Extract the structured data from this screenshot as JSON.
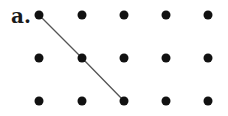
{
  "label": "a.",
  "grid": {
    "cols": [
      39,
      82,
      124,
      166,
      208
    ],
    "rows": [
      15,
      58,
      101
    ],
    "dot_radius": 4.5,
    "dot_color": "#111111"
  },
  "path": {
    "points": [
      [
        39,
        15
      ],
      [
        82,
        58
      ],
      [
        124,
        101
      ]
    ],
    "color": "#555555",
    "width": 1.3
  }
}
